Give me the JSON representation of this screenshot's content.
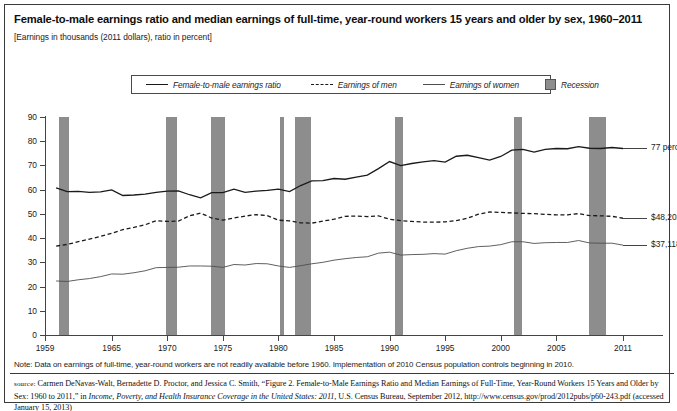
{
  "title": "Female-to-male earnings ratio and median earnings of full-time, year-round workers 15 years and older by sex, 1960–2011",
  "subtitle": "[Earnings in thousands (2011 dollars), ratio in percent]",
  "legend": {
    "position": "top-center",
    "items": [
      {
        "label": "Female-to-male earnings ratio",
        "style": "solid-thick",
        "icon": "line-solid-thick-icon"
      },
      {
        "label": "Earnings of men",
        "style": "dashed",
        "icon": "line-dashed-icon"
      },
      {
        "label": "Earnings of women",
        "style": "solid-thin",
        "icon": "line-solid-thin-icon"
      },
      {
        "label": "Recession",
        "style": "box",
        "icon": "recession-swatch-icon"
      }
    ]
  },
  "annotations": [
    {
      "name": "ratio-end-label",
      "text": "77 percent",
      "value": 77,
      "year": 2011
    },
    {
      "name": "men-end-label",
      "text": "$48,202",
      "value": 48.202,
      "year": 2011
    },
    {
      "name": "women-end-label",
      "text": "$37,118",
      "value": 37.118,
      "year": 2011
    }
  ],
  "note": "Note: Data on earnings of full-time, year-round workers are not readily available before 1960. Implementation of 2010 Census population controls beginning in 2010.",
  "source": {
    "label": "source:",
    "text_1": " Carmen DeNavas-Walt, Bernadette D. Proctor, and Jessica C. Smith, “Figure 2. Female-to-Male Earnings Ratio and Median Earnings of Full-Time, Year-Round Workers 15 Years and Older by Sex: 1960 to 2011,” in ",
    "italic": "Income, Poverty, and Health Insurance Coverage in the United States: 2011,",
    "text_2": " U.S. Census Bureau, September 2012, http://www.census.gov/prod/2012pubs/p60-243.pdf (accessed January 15, 2013)"
  },
  "colors": {
    "ratio_line": "#1a1a1a",
    "men_line": "#1a1a1a",
    "women_line": "#4e4e4e",
    "recession_band": "#8d8d8d",
    "axis": "#444444",
    "border": "#3a3a3a"
  },
  "chart_data": {
    "type": "line",
    "title": "Female-to-male earnings ratio and median earnings of full-time, year-round workers 15 years and older by sex, 1960–2011",
    "subtitle": "[Earnings in thousands (2011 dollars), ratio in percent]",
    "xlabel": "",
    "ylabel": "",
    "xlim": [
      1959,
      2011
    ],
    "ylim": [
      0,
      90
    ],
    "yticks": [
      0,
      10,
      20,
      30,
      40,
      50,
      60,
      70,
      80,
      90
    ],
    "xticks": [
      1959,
      1965,
      1970,
      1975,
      1980,
      1985,
      1990,
      1995,
      2000,
      2005,
      2011
    ],
    "grid": false,
    "x": [
      1960,
      1961,
      1962,
      1963,
      1964,
      1965,
      1966,
      1967,
      1968,
      1969,
      1970,
      1971,
      1972,
      1973,
      1974,
      1975,
      1976,
      1977,
      1978,
      1979,
      1980,
      1981,
      1982,
      1983,
      1984,
      1985,
      1986,
      1987,
      1988,
      1989,
      1990,
      1991,
      1992,
      1993,
      1994,
      1995,
      1996,
      1997,
      1998,
      1999,
      2000,
      2001,
      2002,
      2003,
      2004,
      2005,
      2006,
      2007,
      2008,
      2009,
      2010,
      2011
    ],
    "series": [
      {
        "name": "Female-to-male earnings ratio",
        "unit": "percent",
        "style": "solid-thick",
        "values": [
          60.7,
          59.2,
          59.3,
          58.9,
          59.1,
          59.9,
          57.6,
          57.8,
          58.2,
          58.9,
          59.4,
          59.5,
          57.9,
          56.6,
          58.8,
          58.8,
          60.2,
          58.9,
          59.4,
          59.7,
          60.2,
          59.2,
          61.7,
          63.6,
          63.7,
          64.6,
          64.3,
          65.2,
          66.0,
          68.7,
          71.6,
          69.9,
          70.8,
          71.5,
          72.0,
          71.4,
          73.8,
          74.2,
          73.2,
          72.2,
          73.7,
          76.3,
          76.6,
          75.5,
          76.6,
          77.0,
          76.9,
          77.8,
          77.1,
          77.0,
          77.4,
          77.0
        ]
      },
      {
        "name": "Earnings of men",
        "unit": "thousands of 2011 dollars",
        "style": "dashed",
        "values": [
          36.7,
          37.4,
          38.5,
          39.6,
          40.7,
          42.0,
          43.5,
          44.4,
          45.5,
          47.2,
          46.9,
          47.0,
          49.2,
          50.3,
          48.3,
          47.4,
          48.3,
          49.1,
          49.7,
          49.3,
          47.4,
          47.1,
          46.3,
          46.2,
          47.0,
          47.8,
          49.0,
          49.1,
          48.9,
          49.2,
          47.8,
          47.2,
          46.9,
          46.6,
          46.6,
          46.7,
          47.2,
          48.2,
          49.9,
          50.8,
          50.6,
          50.4,
          50.2,
          50.1,
          49.8,
          49.6,
          49.6,
          50.1,
          49.3,
          49.2,
          49.0,
          48.2
        ]
      },
      {
        "name": "Earnings of women",
        "unit": "thousands of 2011 dollars",
        "style": "solid-thin",
        "values": [
          22.3,
          22.1,
          22.8,
          23.3,
          24.1,
          25.2,
          25.1,
          25.7,
          26.5,
          27.8,
          27.9,
          28.0,
          28.5,
          28.5,
          28.4,
          27.9,
          29.1,
          28.9,
          29.5,
          29.4,
          28.5,
          27.9,
          28.6,
          29.4,
          30.0,
          30.9,
          31.5,
          32.0,
          32.3,
          33.8,
          34.2,
          33.0,
          33.2,
          33.3,
          33.6,
          33.4,
          34.8,
          35.8,
          36.5,
          36.7,
          37.3,
          38.5,
          38.5,
          37.8,
          38.1,
          38.2,
          38.2,
          39.0,
          38.0,
          37.9,
          37.9,
          37.1
        ]
      }
    ],
    "recessions": [
      {
        "start": 1960.3,
        "end": 1961.2
      },
      {
        "start": 1969.9,
        "end": 1970.9
      },
      {
        "start": 1973.9,
        "end": 1975.2
      },
      {
        "start": 1980.1,
        "end": 1980.5
      },
      {
        "start": 1981.5,
        "end": 1982.9
      },
      {
        "start": 1990.5,
        "end": 1991.2
      },
      {
        "start": 2001.2,
        "end": 2001.9
      },
      {
        "start": 2007.9,
        "end": 2009.5
      }
    ]
  }
}
